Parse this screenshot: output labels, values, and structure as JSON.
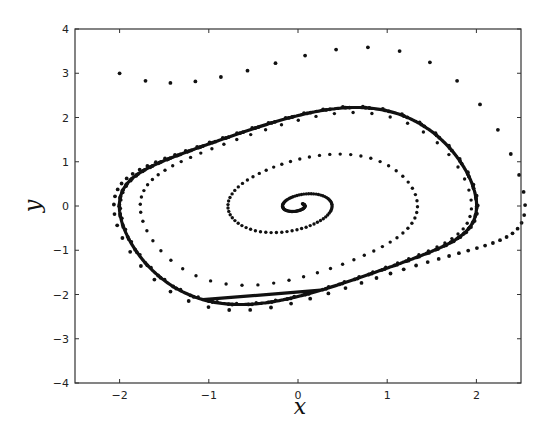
{
  "chart_data": {
    "type": "scatter",
    "title": "",
    "xlabel": "x",
    "ylabel": "y",
    "xlim": [
      -2.5,
      2.5
    ],
    "ylim": [
      -4,
      4
    ],
    "xticks": [
      -2,
      -1,
      0,
      1,
      2
    ],
    "yticks": [
      -4,
      -3,
      -2,
      -1,
      0,
      1,
      2,
      3,
      4
    ],
    "xtick_labels": [
      "−2",
      "−1",
      "0",
      "1",
      "2"
    ],
    "ytick_labels": [
      "−4",
      "−3",
      "−2",
      "−1",
      "0",
      "1",
      "2",
      "3",
      "4"
    ],
    "grid": false,
    "legend": null,
    "system": "Van der Pol oscillator: x' = y, y' = mu(1 - x^2) y - x",
    "mu": 0.5,
    "series": [
      {
        "name": "limit-cycle",
        "style": "solid-line",
        "description": "closed orbit, x range approx [-2.0, 2.0], y range approx [-2.2, 2.2]",
        "points": [
          [
            0.0,
            2.19
          ],
          [
            1.0,
            1.95
          ],
          [
            1.7,
            1.3
          ],
          [
            2.0,
            0.6
          ],
          [
            1.9,
            -0.4
          ],
          [
            1.5,
            -1.3
          ],
          [
            1.0,
            -1.9
          ],
          [
            0.0,
            -2.14
          ],
          [
            -1.0,
            -1.95
          ],
          [
            -1.7,
            -1.3
          ],
          [
            -2.0,
            -0.6
          ],
          [
            -1.9,
            0.4
          ],
          [
            -1.5,
            1.3
          ],
          [
            -1.0,
            1.9
          ]
        ]
      },
      {
        "name": "outer-trajectory",
        "style": "dots",
        "start": [
          -2.0,
          3.0
        ],
        "description": "starts outside, spirals inward onto the limit cycle",
        "points": [
          [
            -2.0,
            3.0
          ],
          [
            -1.67,
            3.17
          ],
          [
            -1.37,
            3.33
          ],
          [
            -1.09,
            3.46
          ],
          [
            -0.81,
            3.55
          ],
          [
            -0.5,
            3.61
          ],
          [
            -0.17,
            3.64
          ],
          [
            0.2,
            3.64
          ],
          [
            0.59,
            3.61
          ],
          [
            1.0,
            3.52
          ],
          [
            1.42,
            3.41
          ],
          [
            1.78,
            3.25
          ],
          [
            2.05,
            3.07
          ],
          [
            2.23,
            2.87
          ],
          [
            2.33,
            2.62
          ],
          [
            2.39,
            2.39
          ],
          [
            2.4,
            2.17
          ],
          [
            2.39,
            1.92
          ],
          [
            2.35,
            1.67
          ],
          [
            2.32,
            1.44
          ]
        ]
      },
      {
        "name": "inner-trajectory",
        "style": "dots",
        "start": [
          0.05,
          0.05
        ],
        "description": "starts near origin, spirals outward onto the limit cycle",
        "points": [
          [
            0.05,
            0.05
          ],
          [
            0.1,
            -0.1
          ],
          [
            0.0,
            -0.25
          ],
          [
            -0.3,
            -0.3
          ],
          [
            -0.6,
            -0.2
          ],
          [
            -0.78,
            0.3
          ],
          [
            -0.7,
            0.8
          ],
          [
            -0.3,
            1.2
          ],
          [
            0.3,
            1.3
          ],
          [
            0.9,
            1.15
          ],
          [
            1.45,
            0.75
          ],
          [
            1.7,
            0.0
          ],
          [
            1.6,
            -0.7
          ],
          [
            1.2,
            -1.5
          ],
          [
            0.5,
            -2.0
          ]
        ]
      }
    ]
  },
  "axes": {
    "box_px": {
      "left": 75,
      "top": 29,
      "right": 521,
      "bottom": 383
    }
  },
  "colors": {
    "line": "#111111",
    "dots": "#111111",
    "axes": "#333333",
    "background": "#ffffff"
  }
}
